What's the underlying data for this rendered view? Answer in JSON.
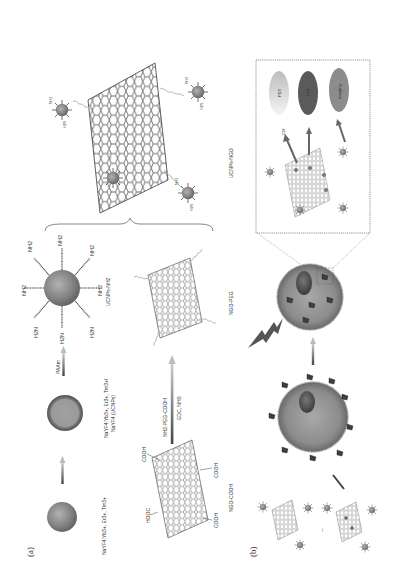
{
  "figure": {
    "orientation": "rotated 90 degrees counter-clockwise",
    "panels": {
      "a": {
        "label": "(a)",
        "core_label": "NaYF4:Yb3+, Er3+, Tm3+",
        "core_shell_label_line1": "NaYF4:Yb3+, Er3+, Tm3+/",
        "core_shell_label_line2": "NaYF4 (UCNPs)",
        "paam_label": "PAAm",
        "ucnps_nh2_label": "UCNPs-NH2",
        "amine_groups": [
          "NH2",
          "NH2",
          "NH2",
          "NH2",
          "NH2",
          "H2N",
          "H2N",
          "H2N"
        ],
        "reaction_reagent_top": "NH2-PEG-COOH",
        "reaction_reagent_bottom": "EDC, NHS",
        "ngo_cooh_label": "NGO-COOH",
        "carboxyl_groups": [
          "COOH",
          "HOOC",
          "COOH",
          "COOH"
        ],
        "ngo_peg_label": "NGO-PEG",
        "product_label": "UCNPs-NGO",
        "small_amine": "NH2",
        "small_amine_rev": "H2N"
      },
      "b": {
        "label": "(b)",
        "inset": {
          "singlet_oxygen_label": "1O2",
          "outcomes": [
            {
              "label": "PDT",
              "color": "#d8d8d8"
            },
            {
              "label": "PTT",
              "color": "#5a5a5a"
            },
            {
              "label": "Imaging",
              "color": "#8c8c8c"
            }
          ]
        },
        "separator": "--"
      }
    },
    "colors": {
      "sphere": "#7a7a7a",
      "sphere_highlight": "#a8a8a8",
      "cell": "#8a8a8a",
      "nucleus": "#4a4a4a",
      "peg": "#b8b8b8",
      "dashed_box": "#666666"
    }
  }
}
